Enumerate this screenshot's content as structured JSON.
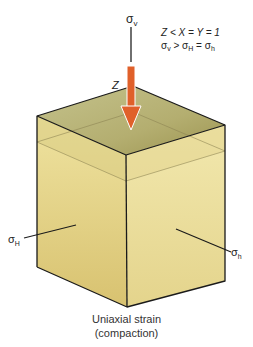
{
  "diagram": {
    "vertical_stress_label": "σ",
    "vertical_stress_sub": "v",
    "z_label": "Z",
    "relation_line1": "Z < X = Y = 1",
    "relation_line2_parts": {
      "s1": "σ",
      "s1_sub": "v",
      "op1": " > ",
      "s2": "σ",
      "s2_sub": "H",
      "op2": " = ",
      "s3": "σ",
      "s3_sub": "h"
    },
    "left_stress_label": "σ",
    "left_stress_sub": "H",
    "right_stress_label": "σ",
    "right_stress_sub": "h",
    "caption_line1": "Uniaxial strain",
    "caption_line2": "(compaction)",
    "colors": {
      "arrow": "#e0602a",
      "top_face": "#b9b47a",
      "left_face": "#e4d386",
      "right_face": "#ece0a0",
      "edge": "#1a1a1a"
    }
  }
}
